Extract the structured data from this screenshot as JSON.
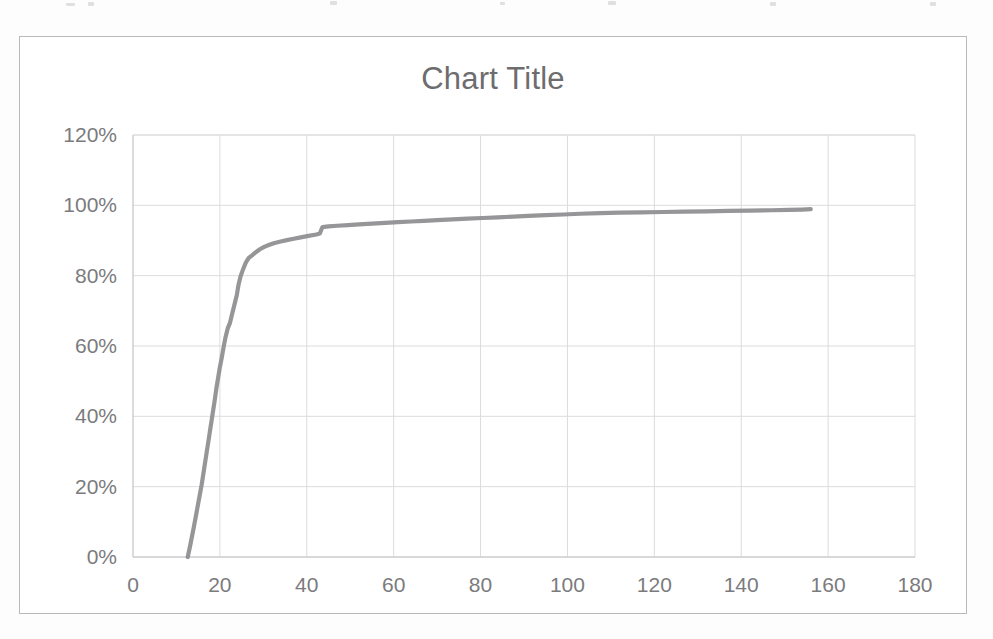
{
  "figure": {
    "background_color": "#ffffff",
    "border_color": "#b9b9bb",
    "scan_artifact": true
  },
  "chart_data": {
    "type": "line",
    "title": "Chart Title",
    "subtitle": "",
    "xlabel": "",
    "ylabel": "",
    "xlim": [
      0,
      180
    ],
    "ylim": [
      0,
      1.2
    ],
    "grid": true,
    "legend": false,
    "legend_position": "none",
    "series_color": "#8d8d8f",
    "grid_color": "#dcdcde",
    "axis_color": "#c4c4c6",
    "tick_label_color": "#7b7b7d",
    "title_color": "#6d6d6f",
    "x_ticks": [
      0,
      20,
      40,
      60,
      80,
      100,
      120,
      140,
      160,
      180
    ],
    "x_tick_labels": [
      "0",
      "20",
      "40",
      "60",
      "80",
      "100",
      "120",
      "140",
      "160",
      "180"
    ],
    "y_ticks": [
      0,
      0.2,
      0.4,
      0.6,
      0.8,
      1.0,
      1.2
    ],
    "y_tick_labels": [
      "0%",
      "20%",
      "40%",
      "60%",
      "80%",
      "100%",
      "120%"
    ],
    "series": [
      {
        "name": "Cumulative %",
        "x": [
          12.6,
          13.2,
          14.0,
          14.6,
          15.2,
          15.8,
          16.3,
          16.8,
          17.3,
          17.8,
          18.3,
          18.8,
          19.2,
          19.6,
          20.0,
          20.4,
          20.9,
          21.3,
          21.8,
          22.3,
          22.8,
          23.3,
          23.9,
          24.3,
          24.8,
          25.4,
          26.0,
          26.6,
          27.4,
          28.2,
          29.2,
          30.2,
          31.4,
          32.6,
          34.0,
          35.4,
          37.0,
          38.6,
          40.4,
          42.2,
          43.0,
          43.6,
          45.0,
          47.0,
          49.5,
          52.0,
          55.0,
          58.0,
          61.0,
          64.0,
          67.0,
          70.0,
          73.5,
          77.0,
          80.5,
          84.0,
          87.5,
          91.0,
          95.0,
          99.0,
          103.0,
          107.5,
          112.0,
          117.0,
          122.0,
          127.0,
          132.0,
          137.0,
          142.0,
          147.0,
          151.0,
          154.0,
          156.0
        ],
        "y": [
          0.0,
          0.035,
          0.085,
          0.125,
          0.165,
          0.205,
          0.245,
          0.285,
          0.325,
          0.365,
          0.405,
          0.445,
          0.48,
          0.51,
          0.54,
          0.565,
          0.6,
          0.625,
          0.65,
          0.665,
          0.69,
          0.715,
          0.745,
          0.775,
          0.8,
          0.82,
          0.838,
          0.85,
          0.858,
          0.866,
          0.875,
          0.882,
          0.888,
          0.893,
          0.897,
          0.901,
          0.905,
          0.909,
          0.913,
          0.917,
          0.92,
          0.938,
          0.94,
          0.942,
          0.944,
          0.946,
          0.948,
          0.95,
          0.952,
          0.954,
          0.956,
          0.958,
          0.96,
          0.962,
          0.964,
          0.966,
          0.968,
          0.97,
          0.972,
          0.974,
          0.976,
          0.978,
          0.979,
          0.98,
          0.981,
          0.982,
          0.983,
          0.984,
          0.985,
          0.986,
          0.987,
          0.988,
          0.989
        ]
      }
    ],
    "annotations": []
  }
}
